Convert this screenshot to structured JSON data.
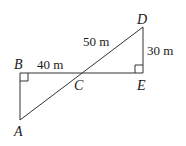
{
  "diagram": {
    "points": {
      "A": {
        "label": "A"
      },
      "B": {
        "label": "B"
      },
      "C": {
        "label": "C"
      },
      "D": {
        "label": "D"
      },
      "E": {
        "label": "E"
      }
    },
    "measurements": {
      "BC": "40 m",
      "CD": "50 m",
      "DE": "30 m"
    },
    "right_angles": [
      "B",
      "E"
    ],
    "line_color": "#333333"
  }
}
